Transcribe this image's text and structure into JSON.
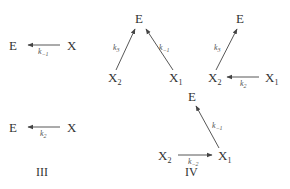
{
  "diagram": {
    "schemes": [
      {
        "id": "scheme-1",
        "label": "",
        "nodes": [
          {
            "name": "E",
            "sub": "",
            "x": 15,
            "y": 45
          },
          {
            "name": "X",
            "sub": "",
            "x": 75,
            "y": 45
          }
        ],
        "edges": [
          {
            "from": "X",
            "to": "E",
            "rate": "k",
            "rate_sub": "−1"
          }
        ]
      },
      {
        "id": "scheme-2",
        "label": "",
        "nodes": [
          {
            "name": "E",
            "sub": "",
            "x": 140,
            "y": 18
          },
          {
            "name": "X",
            "sub": "2",
            "x": 117,
            "y": 77
          },
          {
            "name": "X",
            "sub": "1",
            "x": 176,
            "y": 77
          }
        ],
        "edges": [
          {
            "from": "X2",
            "to": "E",
            "rate": "k",
            "rate_sub": "3"
          },
          {
            "from": "X1",
            "to": "E",
            "rate": "k",
            "rate_sub": "−1"
          }
        ]
      },
      {
        "id": "scheme-3",
        "label": "",
        "nodes": [
          {
            "name": "E",
            "sub": "",
            "x": 240,
            "y": 18
          },
          {
            "name": "X",
            "sub": "2",
            "x": 217,
            "y": 77
          },
          {
            "name": "X",
            "sub": "1",
            "x": 272,
            "y": 77
          }
        ],
        "edges": [
          {
            "from": "X2",
            "to": "E",
            "rate": "k",
            "rate_sub": "3"
          },
          {
            "from": "X1",
            "to": "X2",
            "rate": "k",
            "rate_sub": "2"
          }
        ]
      },
      {
        "id": "scheme-III",
        "label": "III",
        "nodes": [
          {
            "name": "E",
            "sub": "",
            "x": 15,
            "y": 127
          },
          {
            "name": "X",
            "sub": "",
            "x": 75,
            "y": 127
          }
        ],
        "edges": [
          {
            "from": "X",
            "to": "E",
            "rate": "k",
            "rate_sub": "2"
          }
        ]
      },
      {
        "id": "scheme-IV",
        "label": "IV",
        "nodes": [
          {
            "name": "E",
            "sub": "",
            "x": 192,
            "y": 96
          },
          {
            "name": "X",
            "sub": "2",
            "x": 167,
            "y": 155
          },
          {
            "name": "X",
            "sub": "1",
            "x": 225,
            "y": 155
          }
        ],
        "edges": [
          {
            "from": "X1",
            "to": "E",
            "rate": "k",
            "rate_sub": "−1"
          },
          {
            "from": "X2",
            "to": "X1",
            "rate": "k",
            "rate_sub": "−2"
          }
        ]
      }
    ]
  },
  "text": {
    "E": "E",
    "X": "X",
    "k": "k",
    "sub_1": "1",
    "sub_2": "2",
    "sub_3": "3",
    "sub_m1": "−1",
    "sub_m2": "−2",
    "label_III": "III",
    "label_IV": "IV"
  }
}
